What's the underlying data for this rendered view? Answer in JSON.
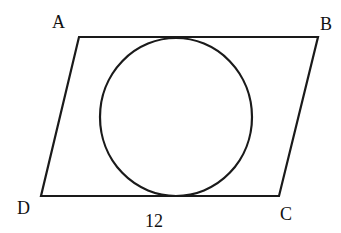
{
  "figure": {
    "shape": "parallelogram with inscribed circle",
    "vertices": {
      "A": {
        "label": "A",
        "x": 79,
        "y": 37
      },
      "B": {
        "label": "B",
        "x": 318,
        "y": 37
      },
      "C": {
        "label": "C",
        "x": 279,
        "y": 196
      },
      "D": {
        "label": "D",
        "x": 41,
        "y": 196
      }
    },
    "circle": {
      "cx": 176,
      "cy": 117,
      "rx": 76,
      "ry": 79
    },
    "side_label": {
      "text": "12",
      "side": "DC"
    },
    "stroke_color": "#1a1a1a"
  }
}
